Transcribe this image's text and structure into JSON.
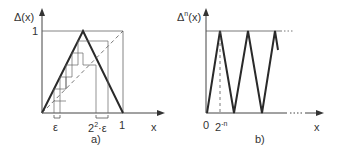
{
  "panel_a": {
    "y_axis_label": "Δ(x)",
    "y_tick_1": "1",
    "x_tick_1": "1",
    "x_axis_label": "x",
    "epsilon_label": "ε",
    "scaled_epsilon_base": "2",
    "scaled_epsilon_exp": "2",
    "scaled_epsilon_suffix": "·ε",
    "caption": "a)"
  },
  "panel_b": {
    "y_axis_base": "Δ",
    "y_axis_exp": "n",
    "y_axis_suffix": "(x)",
    "origin_label": "0",
    "period_base": "2",
    "period_exp": "-n",
    "x_axis_label": "x",
    "caption": "b)"
  },
  "colors": {
    "line": "#2a2a2a",
    "thin": "#555555"
  }
}
